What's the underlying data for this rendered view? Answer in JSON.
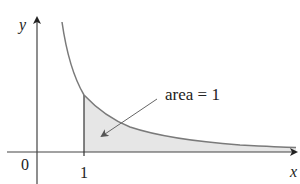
{
  "figure": {
    "type": "improper-integral-area-diagram",
    "axes": {
      "x_label": "x",
      "y_label": "y",
      "origin_label": "0",
      "x_tick_label": "1"
    },
    "annotation": {
      "text": "area = 1"
    },
    "curve": {
      "description": "decreasing curve approaching x-axis asymptotically",
      "shaded_region": "from x = 1 to infinity under the curve"
    },
    "colors": {
      "axis": "#333333",
      "curve": "#7a7a7a",
      "shade": "#e6e6e6",
      "arrow": "#666666",
      "text": "#222222"
    }
  }
}
